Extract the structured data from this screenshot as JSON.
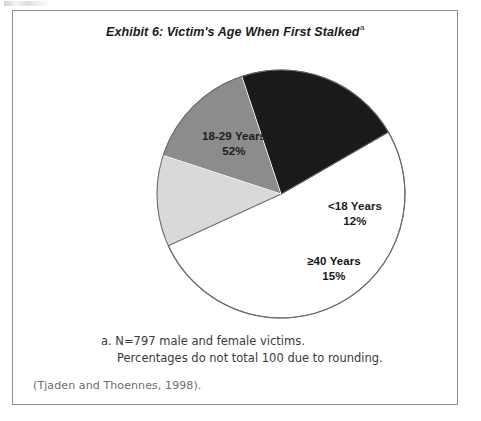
{
  "exhibit": {
    "title": "Exhibit 6: Victim's Age When First Stalked",
    "title_superscript": "a",
    "footnote_marker": "a.",
    "footnote_line1": "a. N=797 male and female victims.",
    "footnote_line2": "Percentages do not total 100 due to rounding.",
    "citation": "(Tjaden and Thoennes, 1998)."
  },
  "chart_data": {
    "type": "pie",
    "title": "Exhibit 6: Victim's Age When First Stalked",
    "categories": [
      "18-29 Years",
      "<18 Years",
      "≥40 Years",
      "30-39 Years"
    ],
    "values": [
      52,
      12,
      15,
      22
    ],
    "value_labels": [
      "52%",
      "12%",
      "15%",
      "22%"
    ],
    "colors": [
      "#ffffff",
      "#d9d9d9",
      "#8c8c8c",
      "#1a1a1a"
    ],
    "label_text_colors": [
      "#1c1c1c",
      "#1c1c1c",
      "#141414",
      "#ffffff"
    ],
    "units": "percent",
    "total": 101,
    "n": 797,
    "start_angle_deg": -30,
    "direction": "clockwise",
    "legend": "none",
    "grid": false,
    "slices": [
      {
        "label": "18-29 Years",
        "value": 52,
        "display": "52%",
        "fill": "#ffffff",
        "text_color": "#1c1c1c"
      },
      {
        "label": "<18 Years",
        "value": 12,
        "display": "12%",
        "fill": "#d9d9d9",
        "text_color": "#1c1c1c"
      },
      {
        "label": "≥40 Years",
        "value": 15,
        "display": "15%",
        "fill": "#8c8c8c",
        "text_color": "#141414"
      },
      {
        "label": "30-39 Years",
        "value": 22,
        "display": "22%",
        "fill": "#1a1a1a",
        "text_color": "#ffffff"
      }
    ]
  }
}
